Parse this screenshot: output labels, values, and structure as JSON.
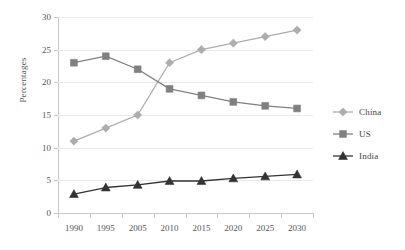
{
  "chart_data": {
    "type": "line",
    "title": "",
    "xlabel": "",
    "ylabel": "Percentages",
    "categories": [
      "1990",
      "1995",
      "2005",
      "2010",
      "2015",
      "2020",
      "2025",
      "2030"
    ],
    "ylim": [
      0,
      30
    ],
    "yticks": [
      "0",
      "5",
      "10",
      "15",
      "20",
      "25",
      "30"
    ],
    "grid": "horizontal",
    "legend_position": "right",
    "series": [
      {
        "name": "China",
        "marker": "diamond",
        "color": "#adadad",
        "values": [
          11,
          13,
          15,
          23,
          25,
          26,
          27,
          28
        ]
      },
      {
        "name": "US",
        "marker": "square",
        "color": "#808080",
        "values": [
          23,
          24,
          22,
          19,
          18,
          17,
          16.4,
          16
        ]
      },
      {
        "name": "India",
        "marker": "triangle",
        "color": "#333333",
        "values": [
          2.9,
          3.9,
          4.3,
          4.9,
          4.9,
          5.3,
          5.6,
          5.9
        ]
      }
    ]
  },
  "axis": {
    "y_title": "Percentages"
  },
  "legend": {
    "items": [
      {
        "label": "China"
      },
      {
        "label": "US"
      },
      {
        "label": "India"
      }
    ]
  }
}
